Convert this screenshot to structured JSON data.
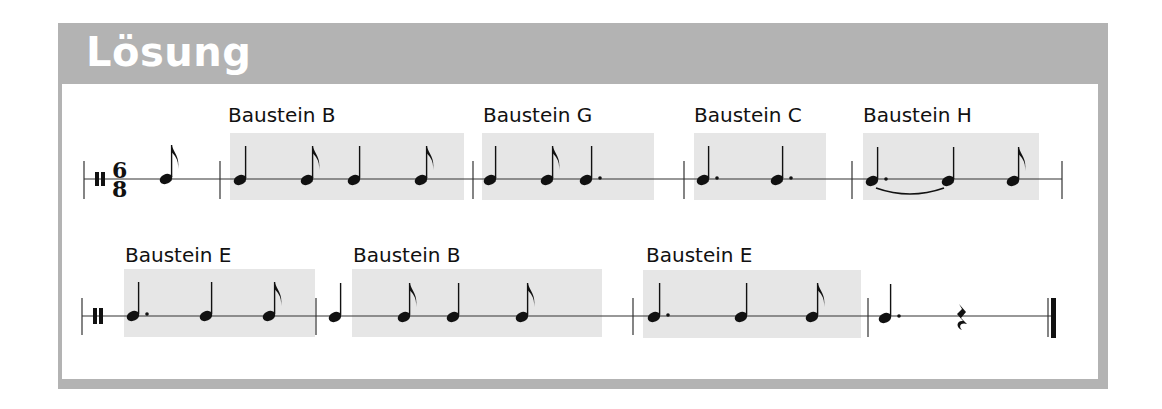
{
  "header": {
    "title": "Lösung"
  },
  "colors": {
    "frame": "#b3b3b3",
    "block_shade": "#e6e6e6",
    "ink": "#111111"
  },
  "time_signature": {
    "numerator": "6",
    "denominator": "8"
  },
  "rows": [
    {
      "blocks": [
        {
          "label": "Baustein B",
          "notes": [
            "quarter",
            "eighth",
            "quarter",
            "eighth"
          ]
        },
        {
          "label": "Baustein G",
          "notes": [
            "quarter",
            "eighth",
            "dotted-quarter"
          ]
        },
        {
          "label": "Baustein C",
          "notes": [
            "dotted-quarter",
            "dotted-quarter"
          ]
        },
        {
          "label": "Baustein H",
          "notes": [
            "dotted-quarter-tied",
            "quarter",
            "eighth"
          ]
        }
      ],
      "pickup": [
        "eighth"
      ]
    },
    {
      "blocks": [
        {
          "label": "Baustein E",
          "notes": [
            "dotted-quarter",
            "quarter",
            "eighth"
          ]
        },
        {
          "label": "Baustein B",
          "notes": [
            "quarter",
            "eighth",
            "quarter",
            "eighth"
          ]
        },
        {
          "label": "Baustein E",
          "notes": [
            "dotted-quarter",
            "quarter",
            "eighth"
          ]
        }
      ],
      "final_bar": [
        "dotted-quarter",
        "quarter-rest"
      ]
    }
  ]
}
